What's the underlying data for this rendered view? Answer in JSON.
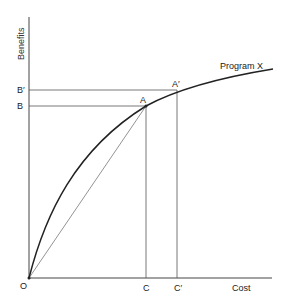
{
  "diagram": {
    "axes": {
      "y_label": "Benefits",
      "x_label": "Cost",
      "origin_label": "O"
    },
    "curve": {
      "label": "Program X"
    },
    "points": {
      "A": "A",
      "A_prime": "A′"
    },
    "y_ticks": {
      "B": "B",
      "B_prime": "B′"
    },
    "x_ticks": {
      "C": "C",
      "C_prime": "C′"
    },
    "colors": {
      "line": "#333333",
      "background": "#ffffff"
    }
  }
}
